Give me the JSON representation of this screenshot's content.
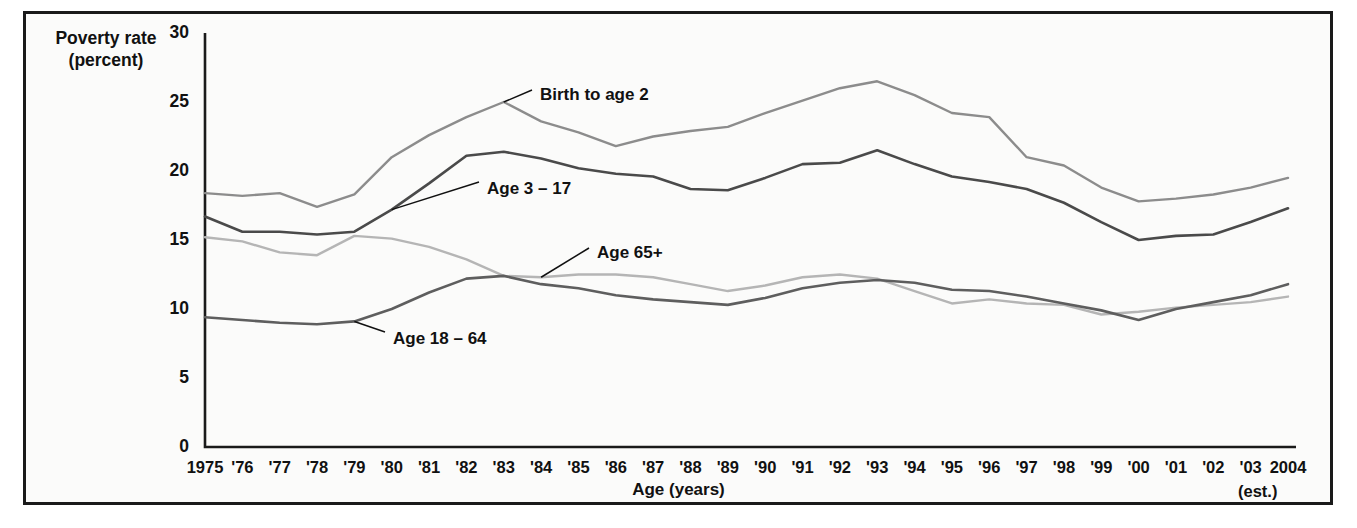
{
  "figure": {
    "y_axis_title_line1": "Poverty rate",
    "y_axis_title_line2": "(percent)",
    "x_axis_title": "Age (years)",
    "estimate_note": "(est.)"
  },
  "chart_data": {
    "type": "line",
    "title": "",
    "xlabel": "Age (years)",
    "ylabel": "Poverty rate (percent)",
    "ylim": [
      0,
      30
    ],
    "yticks": [
      0,
      5,
      10,
      15,
      20,
      25,
      30
    ],
    "grid": false,
    "legend_position": "inline-annotations",
    "x": [
      1975,
      1976,
      1977,
      1978,
      1979,
      1980,
      1981,
      1982,
      1983,
      1984,
      1985,
      1986,
      1987,
      1988,
      1989,
      1990,
      1991,
      1992,
      1993,
      1994,
      1995,
      1996,
      1997,
      1998,
      1999,
      2000,
      2001,
      2002,
      2003,
      2004
    ],
    "categories": [
      "1975",
      "'76",
      "'77",
      "'78",
      "'79",
      "'80",
      "'81",
      "'82",
      "'83",
      "'84",
      "'85",
      "'86",
      "'87",
      "'88",
      "'89",
      "'90",
      "'91",
      "'92",
      "'93",
      "'94",
      "'95",
      "'96",
      "'97",
      "'98",
      "'99",
      "'00",
      "'01",
      "'02",
      "'03",
      "2004"
    ],
    "series": [
      {
        "name": "Birth to age 2",
        "color": "#8c8c8c",
        "values": [
          18.4,
          18.2,
          18.4,
          17.4,
          18.3,
          21.0,
          22.6,
          23.9,
          25.0,
          23.6,
          22.8,
          21.8,
          22.5,
          22.9,
          23.2,
          24.2,
          25.1,
          26.0,
          26.5,
          25.5,
          24.2,
          23.9,
          21.0,
          20.4,
          18.8,
          17.8,
          18.0,
          18.3,
          18.8,
          19.5
        ]
      },
      {
        "name": "Age 3 – 17",
        "color": "#4a4a4a",
        "values": [
          16.7,
          15.6,
          15.6,
          15.4,
          15.6,
          17.2,
          19.1,
          21.1,
          21.4,
          20.9,
          20.2,
          19.8,
          19.6,
          18.7,
          18.6,
          19.5,
          20.5,
          20.6,
          21.5,
          20.5,
          19.6,
          19.2,
          18.7,
          17.7,
          16.3,
          15.0,
          15.3,
          15.4,
          16.3,
          17.3
        ]
      },
      {
        "name": "Age 65+",
        "color": "#b5b5b5",
        "values": [
          15.2,
          14.9,
          14.1,
          13.9,
          15.3,
          15.1,
          14.5,
          13.6,
          12.4,
          12.3,
          12.5,
          12.5,
          12.3,
          11.8,
          11.3,
          11.7,
          12.3,
          12.5,
          12.2,
          11.3,
          10.4,
          10.7,
          10.4,
          10.3,
          9.6,
          9.8,
          10.1,
          10.3,
          10.5,
          10.9
        ]
      },
      {
        "name": "Age 18 – 64",
        "color": "#5e5e5e",
        "values": [
          9.4,
          9.2,
          9.0,
          8.9,
          9.1,
          10.0,
          11.2,
          12.2,
          12.4,
          11.8,
          11.5,
          11.0,
          10.7,
          10.5,
          10.3,
          10.8,
          11.5,
          11.9,
          12.1,
          11.9,
          11.4,
          11.3,
          10.9,
          10.4,
          9.9,
          9.2,
          10.0,
          10.5,
          11.0,
          11.8
        ]
      }
    ],
    "annotations": [
      {
        "text": "Birth to age 2",
        "attach_year": 1983,
        "attach_value": 25.0
      },
      {
        "text": "Age 3 – 17",
        "attach_year": 1980,
        "attach_value": 17.2
      },
      {
        "text": "Age 65+",
        "attach_year": 1984,
        "attach_value": 12.3
      },
      {
        "text": "Age 18 – 64",
        "attach_year": 1979,
        "attach_value": 9.1
      }
    ]
  }
}
